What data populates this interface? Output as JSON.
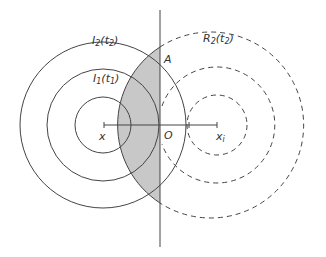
{
  "diagram": {
    "labels": {
      "I2": {
        "base": "I",
        "sub": "2",
        "arg": "t",
        "argsub": "2"
      },
      "I1": {
        "base": "I",
        "sub": "1",
        "arg": "t",
        "argsub": "1"
      },
      "R2": {
        "base": "R",
        "sub": "2",
        "arg": "t",
        "argsub": "2"
      },
      "A": "A",
      "O": "O",
      "x": "x",
      "xi_base": "x",
      "xi_sub": "i"
    },
    "colors": {
      "stroke": "#444444",
      "shade": "#c8c8c8"
    }
  }
}
